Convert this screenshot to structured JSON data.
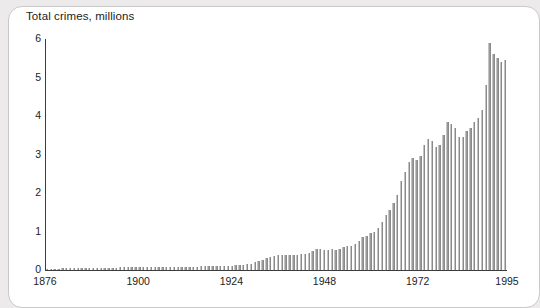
{
  "card": {
    "name": "chart-card"
  },
  "chart_data": {
    "type": "bar",
    "title": "Total crimes, millions",
    "xlabel": "",
    "ylabel": "",
    "ylim": [
      0,
      6
    ],
    "ytick_values": [
      0,
      1,
      2,
      3,
      4,
      5,
      6
    ],
    "ytick_labels": [
      "0",
      "1",
      "2",
      "3",
      "4",
      "5",
      "6"
    ],
    "xtick_values": [
      1876,
      1900,
      1924,
      1948,
      1972,
      1995
    ],
    "xtick_labels": [
      "1876",
      "1900",
      "1924",
      "1948",
      "1972",
      "1995"
    ],
    "xlim": [
      1876,
      1995
    ],
    "grid": false,
    "legend": false,
    "bar_color": "#9a9a9a",
    "axis_color": "#3c3c3c",
    "background_color": "#ffffff",
    "page_background_color": "#eceaea",
    "categories": [
      1876,
      1877,
      1878,
      1879,
      1880,
      1881,
      1882,
      1883,
      1884,
      1885,
      1886,
      1887,
      1888,
      1889,
      1890,
      1891,
      1892,
      1893,
      1894,
      1895,
      1896,
      1897,
      1898,
      1899,
      1900,
      1901,
      1902,
      1903,
      1904,
      1905,
      1906,
      1907,
      1908,
      1909,
      1910,
      1911,
      1912,
      1913,
      1914,
      1915,
      1916,
      1917,
      1918,
      1919,
      1920,
      1921,
      1922,
      1923,
      1924,
      1925,
      1926,
      1927,
      1928,
      1929,
      1930,
      1931,
      1932,
      1933,
      1934,
      1935,
      1936,
      1937,
      1938,
      1939,
      1940,
      1941,
      1942,
      1943,
      1944,
      1945,
      1946,
      1947,
      1948,
      1949,
      1950,
      1951,
      1952,
      1953,
      1954,
      1955,
      1956,
      1957,
      1958,
      1959,
      1960,
      1961,
      1962,
      1963,
      1964,
      1965,
      1966,
      1967,
      1968,
      1969,
      1970,
      1971,
      1972,
      1973,
      1974,
      1975,
      1976,
      1977,
      1978,
      1979,
      1980,
      1981,
      1982,
      1983,
      1984,
      1985,
      1986,
      1987,
      1988,
      1989,
      1990,
      1991,
      1992,
      1993,
      1994,
      1995
    ],
    "values": [
      0.03,
      0.03,
      0.03,
      0.03,
      0.04,
      0.04,
      0.04,
      0.04,
      0.05,
      0.05,
      0.05,
      0.05,
      0.05,
      0.06,
      0.06,
      0.06,
      0.06,
      0.06,
      0.06,
      0.07,
      0.07,
      0.07,
      0.07,
      0.07,
      0.07,
      0.07,
      0.08,
      0.08,
      0.08,
      0.08,
      0.08,
      0.08,
      0.08,
      0.09,
      0.09,
      0.09,
      0.09,
      0.09,
      0.09,
      0.09,
      0.1,
      0.1,
      0.1,
      0.1,
      0.1,
      0.11,
      0.11,
      0.11,
      0.11,
      0.12,
      0.13,
      0.14,
      0.15,
      0.16,
      0.2,
      0.24,
      0.27,
      0.3,
      0.33,
      0.36,
      0.38,
      0.4,
      0.39,
      0.38,
      0.38,
      0.4,
      0.42,
      0.41,
      0.44,
      0.49,
      0.55,
      0.54,
      0.52,
      0.53,
      0.55,
      0.52,
      0.55,
      0.6,
      0.62,
      0.63,
      0.68,
      0.75,
      0.85,
      0.88,
      0.95,
      1.0,
      1.1,
      1.25,
      1.42,
      1.57,
      1.75,
      1.95,
      2.3,
      2.55,
      2.8,
      2.9,
      2.85,
      2.95,
      3.25,
      3.4,
      3.35,
      3.2,
      3.25,
      3.5,
      3.85,
      3.8,
      3.7,
      3.45,
      3.45,
      3.6,
      3.7,
      3.85,
      3.95,
      4.15,
      4.8,
      5.9,
      5.6,
      5.5,
      5.4,
      5.45
    ]
  }
}
